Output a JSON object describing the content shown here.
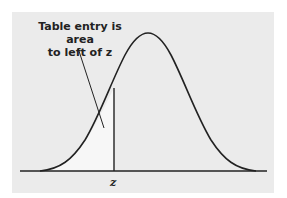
{
  "diagram": {
    "annotation_line1": "Table entry is area",
    "annotation_line2": "to left of z",
    "z_label": "z",
    "colors": {
      "background": "#ebebeb",
      "curve": "#222222",
      "shaded_area": "#f5f5f5"
    }
  }
}
